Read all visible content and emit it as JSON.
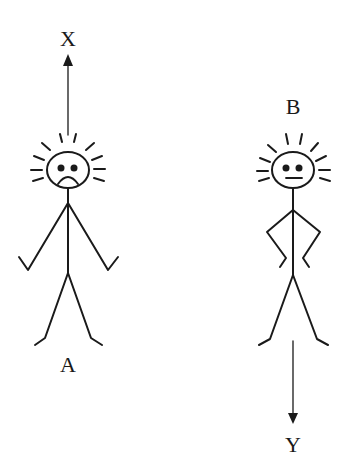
{
  "diagram": {
    "figures": [
      {
        "id": "A",
        "label": "A",
        "expression": "sad",
        "pose": "arms-down",
        "arrow_direction": "up",
        "arrow_label": "X"
      },
      {
        "id": "B",
        "label": "B",
        "expression": "neutral",
        "pose": "hands-on-hips",
        "arrow_direction": "down",
        "arrow_label": "Y"
      }
    ],
    "colors": {
      "ink": "#1a1a1a",
      "background": "#ffffff"
    }
  }
}
